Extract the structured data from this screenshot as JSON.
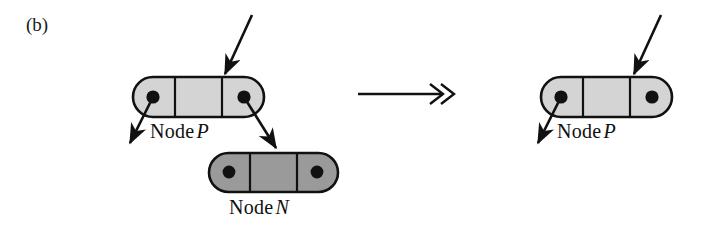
{
  "figure": {
    "panel_label": "(b)",
    "background_color": "#ffffff",
    "ink_color": "#111111",
    "node_fill_light": "#d4d4d4",
    "node_fill_dark": "#9a9a9a",
    "node_stroke": "#111111"
  },
  "before": {
    "node_p": {
      "caption_text": "Node",
      "caption_var": "P",
      "fill": "#d4d4d4",
      "cells": 3,
      "pointer_dots": 2
    },
    "node_n": {
      "caption_text": "Node",
      "caption_var": "N",
      "fill": "#9a9a9a",
      "cells": 3,
      "pointer_dots": 2
    },
    "incoming_arrow": "arrow-into-node-p",
    "left_out_arrow": "arrow-out-left-p",
    "right_out_arrow": "arrow-p-to-n"
  },
  "transition": {
    "symbol_name": "double-headed-right-arrow",
    "glyph": "↠"
  },
  "after": {
    "node_p": {
      "caption_text": "Node",
      "caption_var": "P",
      "fill": "#d4d4d4",
      "cells": 3,
      "pointer_dots": 2
    },
    "incoming_arrow": "arrow-into-node-p",
    "left_out_arrow": "arrow-out-left-p"
  }
}
